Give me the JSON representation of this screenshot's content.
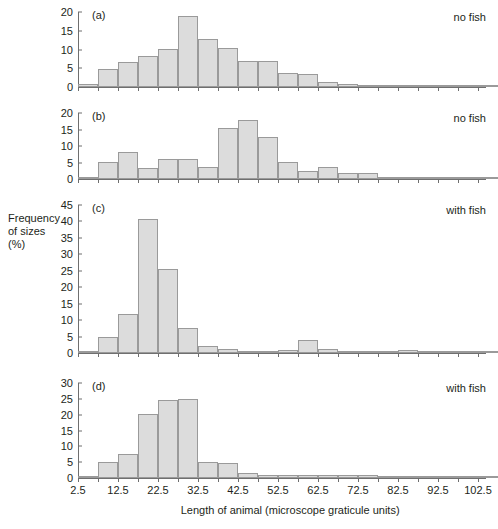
{
  "figure": {
    "y_axis_label": "Frequency\nof sizes\n(%)",
    "x_axis_label": "Length of animal (microscope graticule units)",
    "x_tick_labels": [
      "2.5",
      "12.5",
      "22.5",
      "32.5",
      "42.5",
      "52.5",
      "62.5",
      "72.5",
      "82.5",
      "92.5",
      "102.5"
    ],
    "bar_fill_color": "#dcdcdc",
    "bar_border_color": "#9a9a9a",
    "axis_color": "#6f6f6f"
  },
  "panels": [
    {
      "letter": "(a)",
      "note": "no fish",
      "y_ticks": [
        "0",
        "5",
        "10",
        "15",
        "20"
      ]
    },
    {
      "letter": "(b)",
      "note": "no fish",
      "y_ticks": [
        "0",
        "5",
        "10",
        "15",
        "20"
      ]
    },
    {
      "letter": "(c)",
      "note": "with fish",
      "y_ticks": [
        "0",
        "5",
        "10",
        "15",
        "20",
        "25",
        "30",
        "35",
        "40",
        "45"
      ]
    },
    {
      "letter": "(d)",
      "note": "with fish",
      "y_ticks": [
        "0",
        "5",
        "10",
        "15",
        "20",
        "25",
        "30"
      ]
    }
  ],
  "chart_data": [
    {
      "type": "bar",
      "title": "(a) no fish",
      "xlabel": "Length of animal (microscope graticule units)",
      "ylabel": "Frequency of sizes (%)",
      "xlim": [
        2.5,
        104.5
      ],
      "ylim": [
        0,
        20
      ],
      "bin_width": 5,
      "bin_starts": [
        2.5,
        7.5,
        12.5,
        17.5,
        22.5,
        27.5,
        32.5,
        37.5,
        42.5,
        47.5,
        52.5,
        57.5,
        62.5,
        67.5,
        72.5,
        77.5,
        82.5,
        87.5,
        92.5,
        97.5,
        102.5
      ],
      "values": [
        0.8,
        4.8,
        6.6,
        8.3,
        10.2,
        19.0,
        12.7,
        10.4,
        6.9,
        6.9,
        3.8,
        3.5,
        1.3,
        0.9,
        0.6,
        0.0,
        0.1,
        0.3,
        0.1,
        0.1,
        0.1
      ]
    },
    {
      "type": "bar",
      "title": "(b) no fish",
      "xlabel": "Length of animal (microscope graticule units)",
      "ylabel": "Frequency of sizes (%)",
      "xlim": [
        2.5,
        104.5
      ],
      "ylim": [
        0,
        20
      ],
      "bin_width": 5,
      "bin_starts": [
        2.5,
        7.5,
        12.5,
        17.5,
        22.5,
        27.5,
        32.5,
        37.5,
        42.5,
        47.5,
        52.5,
        57.5,
        62.5,
        67.5,
        72.5,
        77.5,
        82.5,
        87.5,
        92.5,
        97.5,
        102.5
      ],
      "values": [
        0.7,
        5.1,
        8.1,
        3.3,
        6.0,
        6.0,
        3.6,
        15.4,
        17.9,
        12.6,
        5.1,
        2.5,
        3.6,
        1.9,
        1.9,
        0.5,
        0.5,
        0.0,
        0.0,
        0.0,
        0.0
      ]
    },
    {
      "type": "bar",
      "title": "(c) with fish",
      "xlabel": "Length of animal (microscope graticule units)",
      "ylabel": "Frequency of sizes (%)",
      "xlim": [
        2.5,
        104.5
      ],
      "ylim": [
        0,
        45
      ],
      "bin_width": 5,
      "bin_starts": [
        2.5,
        7.5,
        12.5,
        17.5,
        22.5,
        27.5,
        32.5,
        37.5,
        42.5,
        47.5,
        52.5,
        57.5,
        62.5,
        67.5,
        72.5,
        77.5,
        82.5,
        87.5,
        92.5,
        97.5,
        102.5
      ],
      "values": [
        0.0,
        5.0,
        12.0,
        40.6,
        25.6,
        7.6,
        2.1,
        1.3,
        0.7,
        0.6,
        0.9,
        4.0,
        1.2,
        0.4,
        0.2,
        0.0,
        0.8,
        0.0,
        0.0,
        0.0,
        0.0
      ]
    },
    {
      "type": "bar",
      "title": "(d) with fish",
      "xlabel": "Length of animal (microscope graticule units)",
      "ylabel": "Frequency of sizes (%)",
      "xlim": [
        2.5,
        104.5
      ],
      "ylim": [
        0,
        30
      ],
      "bin_width": 5,
      "bin_starts": [
        2.5,
        7.5,
        12.5,
        17.5,
        22.5,
        27.5,
        32.5,
        37.5,
        42.5,
        47.5,
        52.5,
        57.5,
        62.5,
        67.5,
        72.5,
        77.5,
        82.5,
        87.5,
        92.5,
        97.5,
        102.5
      ],
      "values": [
        0.4,
        5.2,
        7.7,
        20.1,
        24.5,
        25.1,
        5.1,
        4.8,
        1.5,
        1.0,
        1.0,
        0.8,
        0.8,
        0.8,
        0.8,
        0.2,
        0.2,
        0.0,
        0.3,
        0.6,
        0.2
      ]
    }
  ]
}
